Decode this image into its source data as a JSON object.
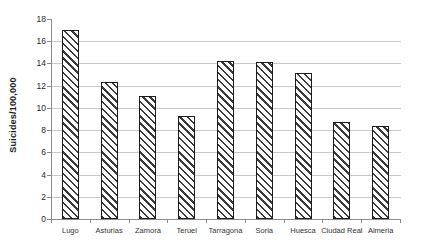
{
  "chart_data": {
    "type": "bar",
    "title": "",
    "xlabel": "",
    "ylabel": "Suicides/100,000",
    "categories": [
      "Lugo",
      "Asturias",
      "Zamora",
      "Teruel",
      "Tarragona",
      "Soria",
      "Huesca",
      "Ciudad Real",
      "Almeria"
    ],
    "values": [
      17.0,
      12.3,
      11.1,
      9.3,
      14.2,
      14.1,
      13.1,
      8.7,
      8.4
    ],
    "ylim": [
      0,
      18
    ],
    "yticks": [
      0,
      2,
      4,
      6,
      8,
      10,
      12,
      14,
      16,
      18
    ],
    "grid": true,
    "legend": false,
    "bar_fill": "white-with-diagonal-hatch",
    "hatch_direction": "backslash",
    "colors": {
      "hatch": "#3a3a3a",
      "bar_border": "#1c1c1c",
      "bar_background": "#ffffff",
      "gridline": "#c9c9c9",
      "axis": "#8c8c8c",
      "tick_text": "#262626",
      "background": "#ffffff"
    }
  }
}
